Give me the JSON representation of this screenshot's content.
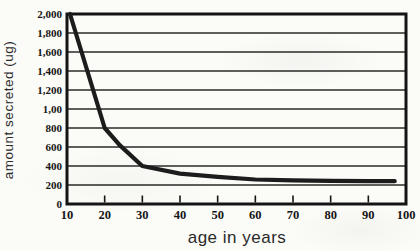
{
  "chart_data": {
    "type": "line",
    "title": "",
    "xlabel": "age in years",
    "ylabel": "amount secreted  (ug)",
    "xlim": [
      10,
      100
    ],
    "ylim": [
      0,
      2000
    ],
    "x_tick_values": [
      10,
      20,
      30,
      40,
      50,
      60,
      70,
      80,
      90,
      100
    ],
    "x_tick_labels": [
      "10",
      "20",
      "30",
      "40",
      "50",
      "60",
      "70",
      "80",
      "90",
      "100"
    ],
    "y_tick_values": [
      0,
      200,
      400,
      600,
      800,
      1000,
      1200,
      1400,
      1600,
      1800,
      2000
    ],
    "y_tick_labels": [
      "0",
      "200",
      "400",
      "600",
      "800",
      "1,00",
      "1,200",
      "1,400",
      "1,600",
      "1,800",
      "2,000"
    ],
    "grid": "horizontal",
    "legend": "none",
    "series": [
      {
        "name": "amount secreted",
        "points": [
          [
            10.8,
            2000
          ],
          [
            20,
            800
          ],
          [
            24,
            620
          ],
          [
            30,
            400
          ],
          [
            40,
            320
          ],
          [
            50,
            285
          ],
          [
            60,
            258
          ],
          [
            70,
            248
          ],
          [
            80,
            243
          ],
          [
            90,
            240
          ],
          [
            97,
            240
          ]
        ]
      }
    ],
    "colors": {
      "line": "#1c1c1c",
      "frame": "#141414",
      "grid": "#2a2a2a",
      "background": "#fbfbf8",
      "text": "#151515"
    }
  }
}
